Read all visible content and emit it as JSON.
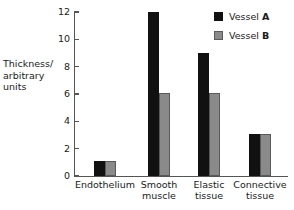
{
  "chart_data": {
    "type": "bar",
    "title": "",
    "xlabel": "",
    "ylabel": "Thickness/ arbitrary units",
    "ylabel_lines": [
      "Thickness/",
      "arbitrary",
      "units"
    ],
    "ylim": [
      0,
      12
    ],
    "yticks": [
      0,
      2,
      4,
      6,
      8,
      10,
      12
    ],
    "ytick_labels": [
      "0",
      "2",
      "4",
      "6",
      "8",
      "10",
      "12"
    ],
    "grid": false,
    "legend_position": "top-right",
    "categories": [
      "Endothelium",
      "Smooth muscle",
      "Elastic tissue",
      "Connective tissue"
    ],
    "category_lines": [
      [
        "Endothelium"
      ],
      [
        "Smooth",
        "muscle"
      ],
      [
        "Elastic",
        "tissue"
      ],
      [
        "Connective",
        "tissue"
      ]
    ],
    "series": [
      {
        "name": "Vessel A",
        "name_prefix": "Vessel ",
        "name_suffix": "A",
        "color": "#111111",
        "border_color": "#111111",
        "values": [
          1.1,
          12,
          9,
          3.1
        ]
      },
      {
        "name": "Vessel B",
        "name_prefix": "Vessel ",
        "name_suffix": "B",
        "color": "#8a8a8a",
        "border_color": "#5a5a5a",
        "values": [
          1.1,
          6.1,
          6.1,
          3.1
        ]
      }
    ],
    "axis_color": "#555555",
    "text_color": "#1a1a1a",
    "background": "#ffffff"
  }
}
